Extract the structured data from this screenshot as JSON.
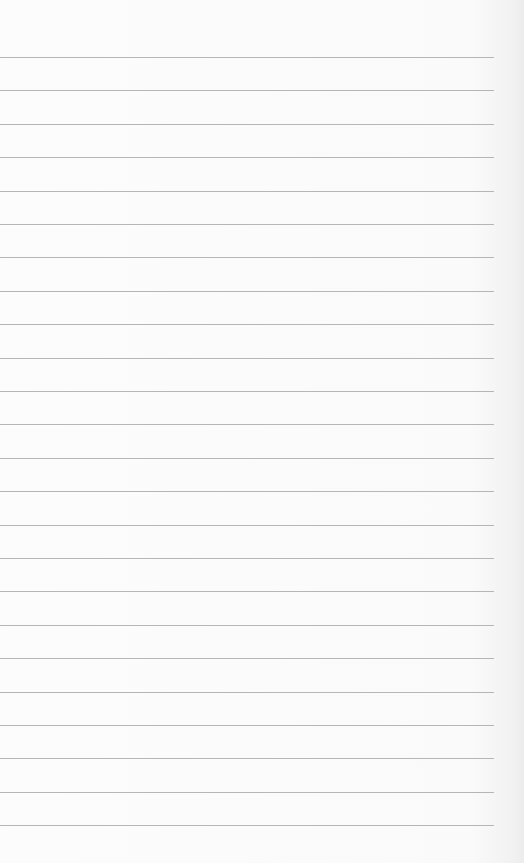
{
  "page": {
    "type": "lined-paper",
    "background_color": "#fbfbfb",
    "line_color": "#a9a9a9",
    "line_count": 24,
    "first_line_y": 57,
    "line_spacing": 33.4,
    "line_width": 494,
    "text": ""
  }
}
